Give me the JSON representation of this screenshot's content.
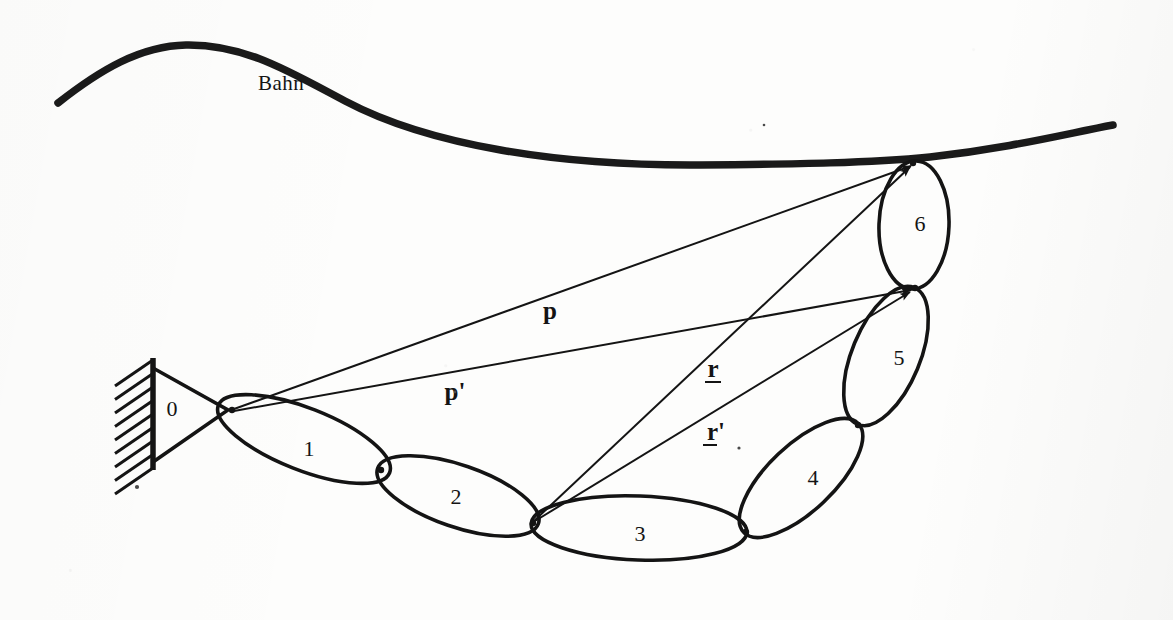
{
  "figure": {
    "background_color": "#fdfdfc",
    "ink_color": "#141414",
    "width": 1173,
    "height": 620
  },
  "curve": {
    "name": "path-curve",
    "label": "Bahn",
    "label_x": 258,
    "label_y": 90,
    "stroke_width": 7.5,
    "points": "M 58 103 C 100 70, 140 46, 186 45 C 245 44, 290 72, 345 101 C 430 146, 560 166, 700 165 C 800 164, 870 163, 930 157 C 1010 148, 1065 134, 1113 125"
  },
  "ground": {
    "name": "fixed-support",
    "wall_x": 153,
    "wall_y1": 358,
    "wall_y2": 470,
    "hatch_count": 9,
    "hatch_dx": -38,
    "hatch_dy": 26,
    "triangle_points": "153,368 153,462 228,410",
    "pivot_x": 228,
    "pivot_y": 410
  },
  "links": [
    {
      "number": "0",
      "label_x": 172,
      "label_y": 416,
      "kind": "frame-triangle"
    },
    {
      "number": "1",
      "label_x": 309,
      "label_y": 456,
      "cx": 304,
      "cy": 439,
      "rx": 92,
      "ry": 31,
      "angle": 21.5
    },
    {
      "number": "2",
      "label_x": 456,
      "label_y": 504,
      "cx": 458,
      "cy": 496,
      "rx": 85,
      "ry": 31,
      "angle": 19.0
    },
    {
      "number": "3",
      "label_x": 640,
      "label_y": 541,
      "cx": 639,
      "cy": 528,
      "rx": 108,
      "ry": 32,
      "angle": 2.2
    },
    {
      "number": "4",
      "label_x": 813,
      "label_y": 485,
      "cx": 801,
      "cy": 478,
      "rx": 79,
      "ry": 33,
      "angle": -43.5
    },
    {
      "number": "5",
      "label_x": 899,
      "label_y": 365,
      "cx": 886,
      "cy": 356,
      "rx": 74,
      "ry": 34,
      "angle": -67.5
    },
    {
      "number": "6",
      "label_x": 920,
      "label_y": 231,
      "cx": 914,
      "cy": 225,
      "rx": 64,
      "ry": 35,
      "angle": -88.0
    }
  ],
  "joints": [
    {
      "name": "joint-0-1",
      "x": 232,
      "y": 410
    },
    {
      "name": "joint-1-2",
      "x": 381,
      "y": 470
    },
    {
      "name": "joint-2-3",
      "x": 533,
      "y": 523
    },
    {
      "name": "joint-3-4",
      "x": 746,
      "y": 532
    },
    {
      "name": "joint-4-5",
      "x": 858,
      "y": 425
    },
    {
      "name": "joint-5-6",
      "x": 915,
      "y": 288
    },
    {
      "name": "joint-6-path",
      "x": 913,
      "y": 163
    }
  ],
  "vectors": [
    {
      "name": "vector-p",
      "label": "p",
      "underlined": false,
      "prime": false,
      "x1": 234,
      "y1": 409,
      "x2": 911,
      "y2": 166,
      "label_x": 550,
      "label_y": 319
    },
    {
      "name": "vector-p-prime",
      "label": "p",
      "underlined": false,
      "prime": true,
      "x1": 234,
      "y1": 411,
      "x2": 911,
      "y2": 290,
      "label_x": 455,
      "label_y": 400
    },
    {
      "name": "vector-r",
      "label": "r",
      "underlined": true,
      "prime": false,
      "x1": 534,
      "y1": 521,
      "x2": 910,
      "y2": 167,
      "label_x": 713,
      "label_y": 377
    },
    {
      "name": "vector-r-prime",
      "label": "r",
      "underlined": true,
      "prime": true,
      "x1": 535,
      "y1": 521,
      "x2": 910,
      "y2": 292,
      "label_x": 716,
      "label_y": 440
    }
  ]
}
